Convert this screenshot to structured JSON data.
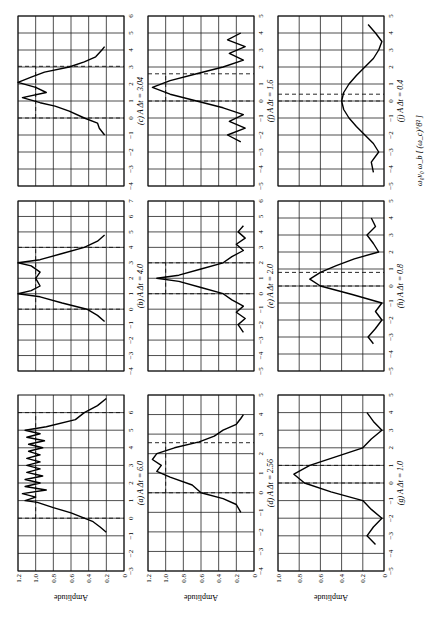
{
  "chart_data": {
    "type": "line",
    "title": "",
    "ylabel": "Amplitude",
    "rotation_deg": -90,
    "panels": [
      {
        "id": "a",
        "label": "(a) A Δt = 6.0",
        "xlim": [
          -3,
          7
        ],
        "xticks": [
          -3,
          -2,
          -1,
          0,
          1,
          2,
          3,
          4,
          5,
          6
        ],
        "ylim": [
          0,
          1.2
        ],
        "yticks": [
          0,
          0.2,
          0.4,
          0.6,
          0.8,
          1.0,
          1.2
        ],
        "dashed_x": [
          0,
          6
        ],
        "dashed_y": 1.0,
        "x": [
          -0.8,
          -0.5,
          -0.2,
          0,
          0.3,
          0.6,
          0.9,
          1.0,
          1.2,
          1.4,
          1.6,
          1.8,
          2.0,
          2.2,
          2.4,
          2.6,
          2.8,
          3.0,
          3.2,
          3.4,
          3.6,
          3.8,
          4.0,
          4.2,
          4.4,
          4.6,
          4.8,
          5.0,
          5.2,
          5.6,
          6.0,
          6.4,
          6.8
        ],
        "y": [
          0.2,
          0.27,
          0.35,
          0.45,
          0.6,
          0.8,
          0.98,
          1.12,
          1.0,
          1.15,
          0.88,
          1.12,
          0.95,
          1.12,
          0.92,
          1.1,
          0.95,
          1.1,
          0.95,
          1.1,
          0.95,
          1.08,
          0.92,
          1.08,
          0.9,
          1.1,
          0.95,
          1.12,
          0.88,
          0.55,
          0.45,
          0.3,
          0.2
        ]
      },
      {
        "id": "b",
        "label": "(b) A Δt = 4.0",
        "xlim": [
          -4,
          7
        ],
        "xticks": [
          -4,
          -3,
          -2,
          -1,
          0,
          1,
          2,
          3,
          4,
          5,
          6,
          7
        ],
        "ylim": [
          0,
          1.2
        ],
        "yticks": [
          0,
          0.2,
          0.4,
          0.6,
          0.8,
          1.0,
          1.2
        ],
        "dashed_x": [
          0,
          4
        ],
        "dashed_y": 1.0,
        "x": [
          -0.8,
          -0.4,
          0,
          0.4,
          0.8,
          1.0,
          1.2,
          1.5,
          2.0,
          2.4,
          2.8,
          3.0,
          3.2,
          3.6,
          4.0,
          4.4,
          4.8
        ],
        "y": [
          0.22,
          0.3,
          0.42,
          0.7,
          0.95,
          1.2,
          1.05,
          0.95,
          1.0,
          0.95,
          1.05,
          1.2,
          0.95,
          0.7,
          0.45,
          0.3,
          0.22
        ]
      },
      {
        "id": "c",
        "label": "(c) A Δt = 3.04",
        "xlim": [
          -4,
          6
        ],
        "xticks": [
          -4,
          -3,
          -2,
          -1,
          0,
          1,
          2,
          3,
          4,
          5,
          6
        ],
        "ylim": [
          0,
          1.2
        ],
        "yticks": [
          0,
          0.2,
          0.4,
          0.6,
          0.8,
          1.0,
          1.2
        ],
        "dashed_x": [
          0,
          3.04
        ],
        "dashed_y": 1.0,
        "x": [
          -1,
          -0.6,
          -0.3,
          0,
          0.4,
          0.7,
          0.9,
          1.2,
          1.5,
          1.8,
          2.1,
          2.4,
          2.7,
          3.0,
          3.3,
          3.6,
          4.0,
          4.2
        ],
        "y": [
          0.22,
          0.28,
          0.3,
          0.45,
          0.62,
          0.78,
          0.95,
          1.15,
          0.88,
          1.0,
          1.2,
          1.05,
          0.9,
          0.62,
          0.45,
          0.32,
          0.25,
          0.22
        ]
      },
      {
        "id": "d",
        "label": "(d) A Δt = 2.56",
        "xlim": [
          -4,
          5
        ],
        "xticks": [
          -4,
          -3,
          -2,
          -1,
          0,
          1,
          2,
          3,
          4,
          5
        ],
        "ylim": [
          0,
          1.2
        ],
        "yticks": [
          0,
          0.2,
          0.4,
          0.6,
          0.8,
          1.0,
          1.2
        ],
        "dashed_x": [
          0,
          2.56
        ],
        "dashed_y": 1.0,
        "x": [
          -1,
          -0.6,
          -0.3,
          0,
          0.4,
          0.8,
          1.1,
          1.4,
          1.7,
          2.0,
          2.3,
          2.6,
          2.9,
          3.2,
          3.5,
          3.8,
          4.0
        ],
        "y": [
          0.15,
          0.2,
          0.35,
          0.6,
          0.7,
          0.95,
          1.1,
          1.05,
          1.15,
          1.1,
          0.9,
          0.62,
          0.45,
          0.35,
          0.2,
          0.15,
          0.12
        ]
      },
      {
        "id": "e",
        "label": "(e) A Δt = 2.0",
        "xlim": [
          -5,
          6
        ],
        "xticks": [
          -5,
          -4,
          -3,
          -2,
          -1,
          0,
          1,
          2,
          3,
          4,
          5,
          6
        ],
        "ylim": [
          0,
          1.2
        ],
        "yticks": [
          0,
          0.2,
          0.4,
          0.6,
          0.8,
          1.0,
          1.2
        ],
        "dashed_x": [
          0,
          2
        ],
        "dashed_y": 1.0,
        "x": [
          -2.5,
          -2.0,
          -1.6,
          -1.2,
          -0.8,
          -0.4,
          0,
          0.4,
          0.8,
          1.0,
          1.2,
          1.6,
          2.0,
          2.4,
          2.8,
          3.2,
          3.6,
          4.0,
          4.4
        ],
        "y": [
          0.12,
          0.18,
          0.1,
          0.2,
          0.12,
          0.25,
          0.35,
          0.6,
          0.85,
          1.1,
          0.85,
          0.6,
          0.35,
          0.25,
          0.12,
          0.2,
          0.1,
          0.18,
          0.12
        ]
      },
      {
        "id": "f",
        "label": "(f) A Δt = 1.6",
        "xlim": [
          -5,
          5
        ],
        "xticks": [
          -5,
          -4,
          -3,
          -2,
          -1,
          0,
          1,
          2,
          3,
          4,
          5
        ],
        "ylim": [
          0,
          1.2
        ],
        "yticks": [
          0,
          0.2,
          0.4,
          0.6,
          0.8,
          1.0,
          1.2
        ],
        "dashed_x": [
          0,
          1.6
        ],
        "dashed_y": 1.0,
        "x": [
          -2.4,
          -2.0,
          -1.6,
          -1.2,
          -0.8,
          -0.4,
          0,
          0.4,
          0.8,
          1.2,
          1.6,
          2.0,
          2.4,
          2.8,
          3.2,
          3.6,
          4.0
        ],
        "y": [
          0.15,
          0.3,
          0.1,
          0.28,
          0.12,
          0.35,
          0.65,
          0.95,
          1.15,
          0.95,
          0.65,
          0.35,
          0.12,
          0.28,
          0.1,
          0.3,
          0.15
        ]
      },
      {
        "id": "g",
        "label": "(g) A Δt = 1.0",
        "xlim": [
          -5,
          5
        ],
        "xticks": [
          -5,
          -4,
          -3,
          -2,
          -1,
          0,
          1,
          2,
          3,
          4,
          5
        ],
        "ylim": [
          0,
          1.0
        ],
        "yticks": [
          0,
          0.2,
          0.4,
          0.6,
          0.8,
          1.0
        ],
        "dashed_x": [
          0,
          1
        ],
        "dashed_y": null,
        "x": [
          -3.5,
          -3.0,
          -2.5,
          -2.0,
          -1.5,
          -1.0,
          -0.5,
          0,
          0.5,
          1.0,
          1.5,
          2.0,
          2.5,
          3.0,
          3.5,
          4.0
        ],
        "y": [
          0.08,
          0.16,
          0.1,
          0.02,
          0.12,
          0.2,
          0.5,
          0.75,
          0.85,
          0.7,
          0.45,
          0.2,
          0.12,
          0.02,
          0.1,
          0.16
        ]
      },
      {
        "id": "h",
        "label": "(h) A Δt = 0.8",
        "xlim": [
          -5,
          5
        ],
        "xticks": [
          -5,
          -4,
          -3,
          -2,
          -1,
          0,
          1,
          2,
          3,
          4,
          5
        ],
        "ylim": [
          0,
          1.0
        ],
        "yticks": [
          0,
          0.2,
          0.4,
          0.6,
          0.8,
          1.0
        ],
        "dashed_x": [
          0,
          0.8
        ],
        "dashed_y": null,
        "x": [
          -3.4,
          -3.0,
          -2.5,
          -2.0,
          -1.5,
          -1.0,
          -0.5,
          0,
          0.4,
          0.8,
          1.2,
          1.6,
          2.0,
          2.5,
          3.0,
          3.5,
          4.0
        ],
        "y": [
          0.1,
          0.15,
          0.08,
          0.02,
          0.08,
          0.02,
          0.3,
          0.6,
          0.7,
          0.6,
          0.45,
          0.28,
          0.05,
          0.1,
          0.16,
          0.08,
          0.12
        ]
      },
      {
        "id": "j",
        "label": "(j) A Δt = 0.4",
        "xlim": [
          -5,
          5
        ],
        "xticks": [
          -5,
          -4,
          -3,
          -2,
          -1,
          0,
          1,
          2,
          3,
          4,
          5
        ],
        "ylim": [
          0,
          1.0
        ],
        "yticks": [
          0,
          0.2,
          0.4,
          0.6,
          0.8,
          1.0
        ],
        "dashed_x": [
          0,
          0.4
        ],
        "dashed_y": null,
        "x": [
          -4.2,
          -3.6,
          -3.0,
          -2.5,
          -2.0,
          -1.5,
          -1.0,
          -0.5,
          0,
          0.5,
          1.0,
          1.5,
          2.0,
          2.5,
          3.0,
          3.5,
          4.0,
          4.5
        ],
        "y": [
          0.1,
          0.12,
          0.05,
          0.1,
          0.18,
          0.26,
          0.33,
          0.38,
          0.4,
          0.38,
          0.33,
          0.26,
          0.18,
          0.1,
          0.05,
          0.02,
          0.08,
          0.15
        ]
      }
    ],
    "caption_fragment": "ω₀ν₀ ω_b [ (ω_c)^8² ]"
  }
}
